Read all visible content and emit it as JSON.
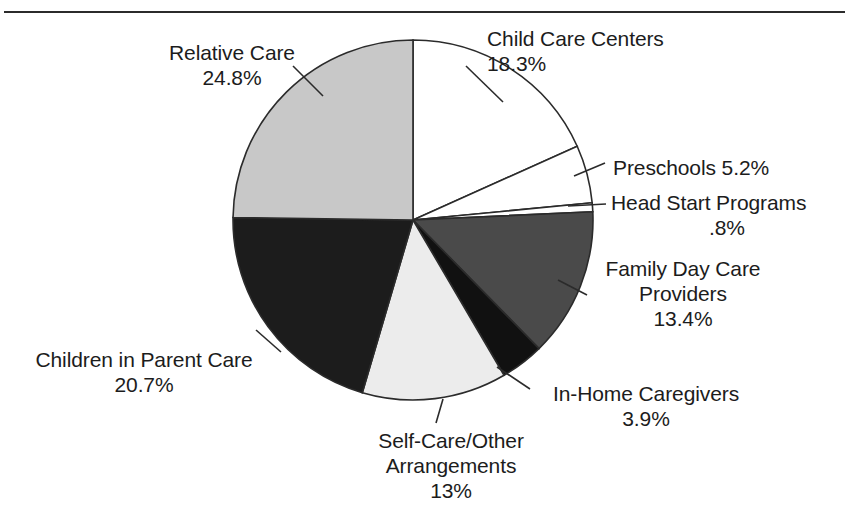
{
  "figure": {
    "title": "",
    "top_rule": true
  },
  "chart_data": {
    "type": "pie",
    "title": "",
    "xlabel": "",
    "ylabel": "",
    "units": "percent",
    "start_angle_deg": 0,
    "direction": "clockwise",
    "center": {
      "x": 413,
      "y": 220
    },
    "radius": 180,
    "total": 100.1,
    "categories": [
      "Child Care Centers",
      "Preschools",
      "Head Start Programs",
      "Family Day Care Providers",
      "In-Home Caregivers",
      "Self-Care/Other Arrangements",
      "Children in Parent Care",
      "Relative Care"
    ],
    "values": [
      18.3,
      5.2,
      0.8,
      13.4,
      3.9,
      13.0,
      20.7,
      24.8
    ],
    "value_labels": [
      "18.3%",
      "5.2%",
      ".8%",
      "13.4%",
      "3.9%",
      "13%",
      "20.7%",
      "24.8%"
    ],
    "colors": [
      "#ffffff",
      "#ffffff",
      "#ffffff",
      "#4a4a4a",
      "#111111",
      "#ececec",
      "#1c1c1c",
      "#c8c8c8"
    ],
    "slices": [
      {
        "name": "Child Care Centers",
        "value": 18.3,
        "value_label": "18.3%",
        "color": "#ffffff"
      },
      {
        "name": "Preschools",
        "value": 5.2,
        "value_label": "5.2%",
        "color": "#ffffff"
      },
      {
        "name": "Head Start Programs",
        "value": 0.8,
        "value_label": ".8%",
        "color": "#ffffff"
      },
      {
        "name": "Family Day Care Providers",
        "value": 13.4,
        "value_label": "13.4%",
        "color": "#4a4a4a"
      },
      {
        "name": "In-Home Caregivers",
        "value": 3.9,
        "value_label": "3.9%",
        "color": "#111111"
      },
      {
        "name": "Self-Care/Other Arrangements",
        "value": 13.0,
        "value_label": "13%",
        "color": "#ececec"
      },
      {
        "name": "Children in Parent Care",
        "value": 20.7,
        "value_label": "20.7%",
        "color": "#1c1c1c"
      },
      {
        "name": "Relative Care",
        "value": 24.8,
        "value_label": "24.8%",
        "color": "#c8c8c8"
      }
    ],
    "legend": "none",
    "grid": false
  },
  "labels": {
    "child_care_centers": {
      "line1": "Child Care Centers",
      "line2": "18.3%"
    },
    "relative_care": {
      "line1": "Relative Care",
      "line2": "24.8%"
    },
    "preschools": {
      "line1": "Preschools 5.2%"
    },
    "head_start": {
      "line1": "Head Start Programs",
      "line2": ".8%"
    },
    "family_day_care": {
      "line1": "Family Day Care",
      "line2": "Providers",
      "line3": "13.4%"
    },
    "in_home": {
      "line1": "In-Home Caregivers",
      "line2": "3.9%"
    },
    "self_care": {
      "line1": "Self-Care/Other",
      "line2": "Arrangements",
      "line3": "13%"
    },
    "parent_care": {
      "line1": "Children in Parent Care",
      "line2": "20.7%"
    }
  }
}
